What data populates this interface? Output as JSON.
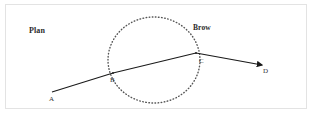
{
  "figure": {
    "title_label": "Plan",
    "feature_label": "Brow",
    "background_color": "#ffffff",
    "frame_color": "#e3e3e3",
    "line_color": "#1a1a1a",
    "dot_color": "#555555",
    "points": [
      {
        "id": "A",
        "label": "A",
        "x": 52,
        "y": 92
      },
      {
        "id": "B",
        "label": "B",
        "x": 113,
        "y": 73
      },
      {
        "id": "C",
        "label": "C",
        "x": 196,
        "y": 53
      },
      {
        "id": "D",
        "label": "D",
        "x": 266,
        "y": 65
      }
    ],
    "path": {
      "segments": [
        {
          "from": "A",
          "to": "B"
        },
        {
          "from": "B",
          "to": "C"
        },
        {
          "from": "C",
          "to": "D"
        }
      ],
      "arrowhead_at": "D"
    },
    "circle": {
      "style": "dotted",
      "center_x": 154,
      "center_y": 60,
      "radius_x": 46,
      "radius_y": 43
    }
  }
}
